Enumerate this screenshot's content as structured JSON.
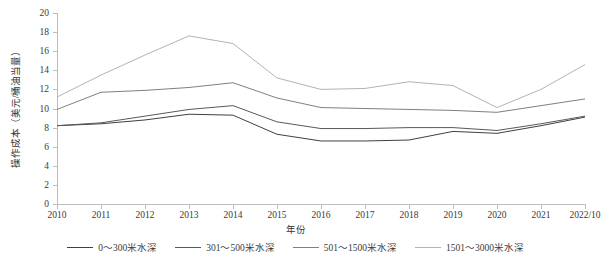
{
  "chart_data": {
    "type": "line",
    "title": "",
    "xlabel": "年份",
    "ylabel": "操作成本（美元/桶油当量）",
    "categories": [
      "2010",
      "2011",
      "2012",
      "2013",
      "2014",
      "2015",
      "2016",
      "2017",
      "2018",
      "2019",
      "2020",
      "2021",
      "2022/10"
    ],
    "x_tick_labels": [
      "2010",
      "2011",
      "2012",
      "2013",
      "2014",
      "2015",
      "2016",
      "2017",
      "2018",
      "2019",
      "2020",
      "2021",
      "2022/10"
    ],
    "y_tick_labels": [
      "0",
      "2",
      "4",
      "6",
      "8",
      "10",
      "12",
      "14",
      "16",
      "18",
      "20"
    ],
    "ylim": [
      0,
      20
    ],
    "y_tick_step": 2,
    "grid": false,
    "legend_position": "bottom",
    "series": [
      {
        "name": "0～300米水深",
        "color": "#404040",
        "values": [
          8.2,
          8.4,
          8.8,
          9.4,
          9.3,
          7.3,
          6.6,
          6.6,
          6.7,
          7.6,
          7.4,
          8.2,
          9.1
        ]
      },
      {
        "name": "301～500米水深",
        "color": "#595959",
        "values": [
          8.2,
          8.5,
          9.2,
          9.9,
          10.3,
          8.6,
          7.9,
          7.9,
          8.0,
          8.0,
          7.7,
          8.4,
          9.2
        ]
      },
      {
        "name": "501～1500米水深",
        "color": "#7f7f7f",
        "values": [
          9.9,
          11.7,
          11.9,
          12.2,
          12.7,
          11.1,
          10.1,
          10.0,
          9.9,
          9.8,
          9.6,
          10.3,
          11.0
        ]
      },
      {
        "name": "1501～3000米水深",
        "color": "#b3b3b3",
        "values": [
          11.2,
          13.5,
          15.6,
          17.6,
          16.8,
          13.2,
          12.0,
          12.1,
          12.8,
          12.4,
          10.1,
          12.0,
          14.6
        ]
      }
    ]
  }
}
